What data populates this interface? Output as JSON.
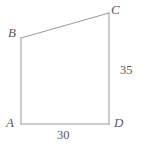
{
  "figure": {
    "kind": "geometry-diagram",
    "shape": "quadrilateral",
    "background_color": "#ffffff",
    "stroke_color": "#9a9a9a",
    "text_color": "#5a5a5a",
    "stroke_width": 1,
    "vertices": [
      {
        "name": "A",
        "label": "A",
        "x": 21,
        "y": 124
      },
      {
        "name": "B",
        "label": "B",
        "x": 21,
        "y": 38
      },
      {
        "name": "C",
        "label": "C",
        "x": 109,
        "y": 13
      },
      {
        "name": "D",
        "label": "D",
        "x": 109,
        "y": 124
      }
    ],
    "edges": [
      {
        "name": "AB",
        "from": "A",
        "to": "B",
        "label": ""
      },
      {
        "name": "BC",
        "from": "B",
        "to": "C",
        "label": ""
      },
      {
        "name": "CD",
        "from": "C",
        "to": "D",
        "label": "35"
      },
      {
        "name": "DA",
        "from": "D",
        "to": "A",
        "label": "30"
      }
    ],
    "measurements": {
      "side_cd": "35",
      "side_ad": "30"
    }
  }
}
